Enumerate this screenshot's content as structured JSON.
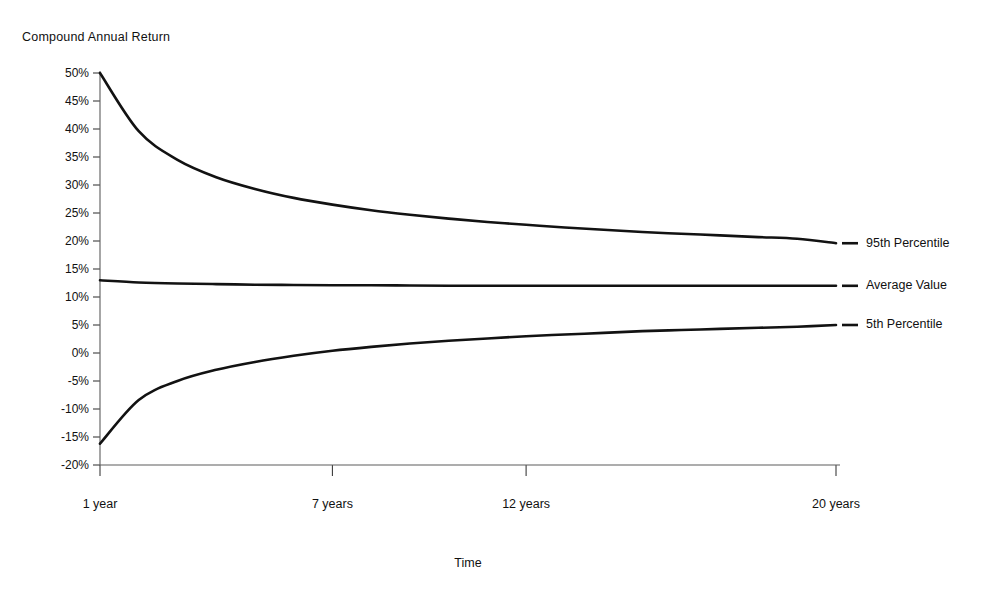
{
  "chart_data": {
    "type": "line",
    "title": "",
    "ylabel": "Compound Annual Return",
    "xlabel": "Time",
    "grid": false,
    "legend_position": "right-inline",
    "x": [
      1,
      2,
      3,
      4,
      5,
      6,
      7,
      8,
      9,
      10,
      11,
      12,
      13,
      14,
      15,
      16,
      17,
      18,
      19,
      20
    ],
    "xlim": [
      1,
      20
    ],
    "ylim": [
      -20,
      50
    ],
    "ytick_labels": [
      "50%",
      "45%",
      "40%",
      "35%",
      "30%",
      "25%",
      "20%",
      "15%",
      "10%",
      "5%",
      "0%",
      "-5%",
      "-10%",
      "-15%",
      "-20%"
    ],
    "ytick_values": [
      50,
      45,
      40,
      35,
      30,
      25,
      20,
      15,
      10,
      5,
      0,
      -5,
      -10,
      -15,
      -20
    ],
    "xtick_labels": [
      "1 year",
      "7 years",
      "12 years",
      "20 years"
    ],
    "xtick_values": [
      1,
      7,
      12,
      20
    ],
    "series": [
      {
        "name": "95th Percentile",
        "values": [
          50.0,
          39.6,
          34.5,
          31.4,
          29.3,
          27.7,
          26.5,
          25.5,
          24.7,
          24.0,
          23.4,
          22.9,
          22.4,
          22.0,
          21.6,
          21.3,
          21.0,
          20.7,
          20.4,
          19.6
        ]
      },
      {
        "name": "Average Value",
        "values": [
          13.0,
          12.6,
          12.4,
          12.3,
          12.2,
          12.15,
          12.1,
          12.1,
          12.05,
          12.0,
          12.0,
          12.0,
          12.0,
          12.0,
          12.0,
          12.0,
          12.0,
          12.0,
          12.0,
          12.0
        ]
      },
      {
        "name": "5th Percentile",
        "values": [
          -16.2,
          -8.4,
          -5.0,
          -3.0,
          -1.6,
          -0.5,
          0.4,
          1.1,
          1.7,
          2.2,
          2.6,
          3.0,
          3.3,
          3.6,
          3.9,
          4.1,
          4.3,
          4.5,
          4.7,
          5.0
        ]
      }
    ]
  },
  "axis": {
    "y_title": "Compound Annual Return",
    "x_title": "Time"
  },
  "legend": {
    "items": [
      {
        "label": "95th Percentile"
      },
      {
        "label": "Average Value"
      },
      {
        "label": "5th Percentile"
      }
    ]
  },
  "colors": {
    "curve": "#121212",
    "axis": "#5c5c5c",
    "text": "#111111",
    "background": "#ffffff"
  }
}
